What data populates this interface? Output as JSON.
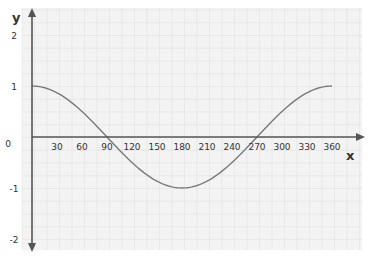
{
  "chart_data": {
    "type": "line",
    "title": "",
    "xlabel": "x",
    "ylabel": "y",
    "xlim": [
      0,
      360
    ],
    "ylim": [
      -2,
      2
    ],
    "grid": true,
    "x_ticks": [
      "30",
      "60",
      "90",
      "120",
      "150",
      "180",
      "210",
      "240",
      "270",
      "300",
      "330",
      "360"
    ],
    "y_ticks": [
      "2",
      "1",
      "0",
      "-1",
      "-2"
    ],
    "series": [
      {
        "name": "y = cos x",
        "x": [
          0,
          30,
          60,
          90,
          120,
          150,
          180,
          210,
          240,
          270,
          300,
          330,
          360
        ],
        "values": [
          1,
          0.87,
          0.5,
          0,
          -0.5,
          -0.87,
          -1,
          -0.87,
          -0.5,
          0,
          0.5,
          0.87,
          1
        ]
      }
    ]
  },
  "colors": {
    "curve": "#7a7a7a",
    "axis": "#555555",
    "grid": "#e2e2e2",
    "paper": "#f3f3f3"
  }
}
